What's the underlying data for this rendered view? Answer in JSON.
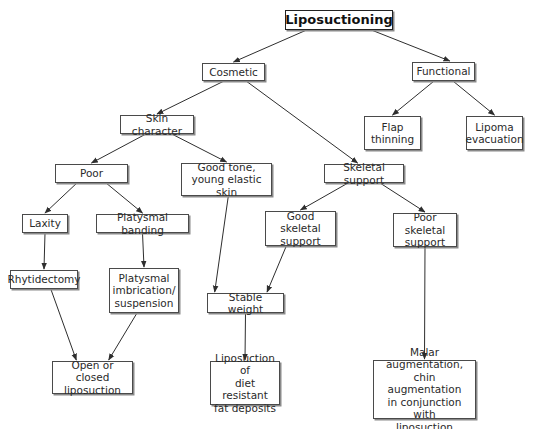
{
  "diagram": {
    "type": "flowchart",
    "colors": {
      "line": "#2e2e2e",
      "box_border": "#4a4a4a",
      "text": "#2a2a2a",
      "background": "#ffffff"
    },
    "nodes": {
      "liposuctioning": "Liposuctioning",
      "cosmetic": "Cosmetic",
      "functional": "Functional",
      "flap_thinning": "Flap\nthinning",
      "lipoma_evacuation": "Lipoma\nevacuation",
      "skin_character": "Skin character",
      "poor": "Poor",
      "good_tone": "Good tone,\nyoung elastic skin",
      "skeletal_support": "Skeletal support",
      "laxity": "Laxity",
      "platysmal_banding": "Platysmal banding",
      "good_skeletal_support": "Good skeletal\nsupport",
      "poor_skeletal_support": "Poor skeletal\nsupport",
      "rhytidectomy": "Rhytidectomy",
      "platysmal_imbrication": "Platysmal\nimbrication/\nsuspension",
      "stable_weight": "Stable weight",
      "open_closed_liposuction": "Open or closed\nliposuction",
      "liposuction_diet_resistant": "Liposuction of\ndiet resistant\nfat deposits",
      "malar_augmentation": "Malar augmentation,\nchin augmentation\nin conjunction with\nliposuction"
    },
    "edges": [
      [
        "liposuctioning",
        "cosmetic"
      ],
      [
        "liposuctioning",
        "functional"
      ],
      [
        "functional",
        "flap_thinning"
      ],
      [
        "functional",
        "lipoma_evacuation"
      ],
      [
        "cosmetic",
        "skin_character"
      ],
      [
        "cosmetic",
        "skeletal_support"
      ],
      [
        "skin_character",
        "poor"
      ],
      [
        "skin_character",
        "good_tone"
      ],
      [
        "poor",
        "laxity"
      ],
      [
        "poor",
        "platysmal_banding"
      ],
      [
        "laxity",
        "rhytidectomy"
      ],
      [
        "platysmal_banding",
        "platysmal_imbrication"
      ],
      [
        "rhytidectomy",
        "open_closed_liposuction"
      ],
      [
        "platysmal_imbrication",
        "open_closed_liposuction"
      ],
      [
        "good_tone",
        "stable_weight"
      ],
      [
        "skeletal_support",
        "good_skeletal_support"
      ],
      [
        "skeletal_support",
        "poor_skeletal_support"
      ],
      [
        "good_skeletal_support",
        "stable_weight"
      ],
      [
        "stable_weight",
        "liposuction_diet_resistant"
      ],
      [
        "poor_skeletal_support",
        "malar_augmentation"
      ]
    ]
  }
}
